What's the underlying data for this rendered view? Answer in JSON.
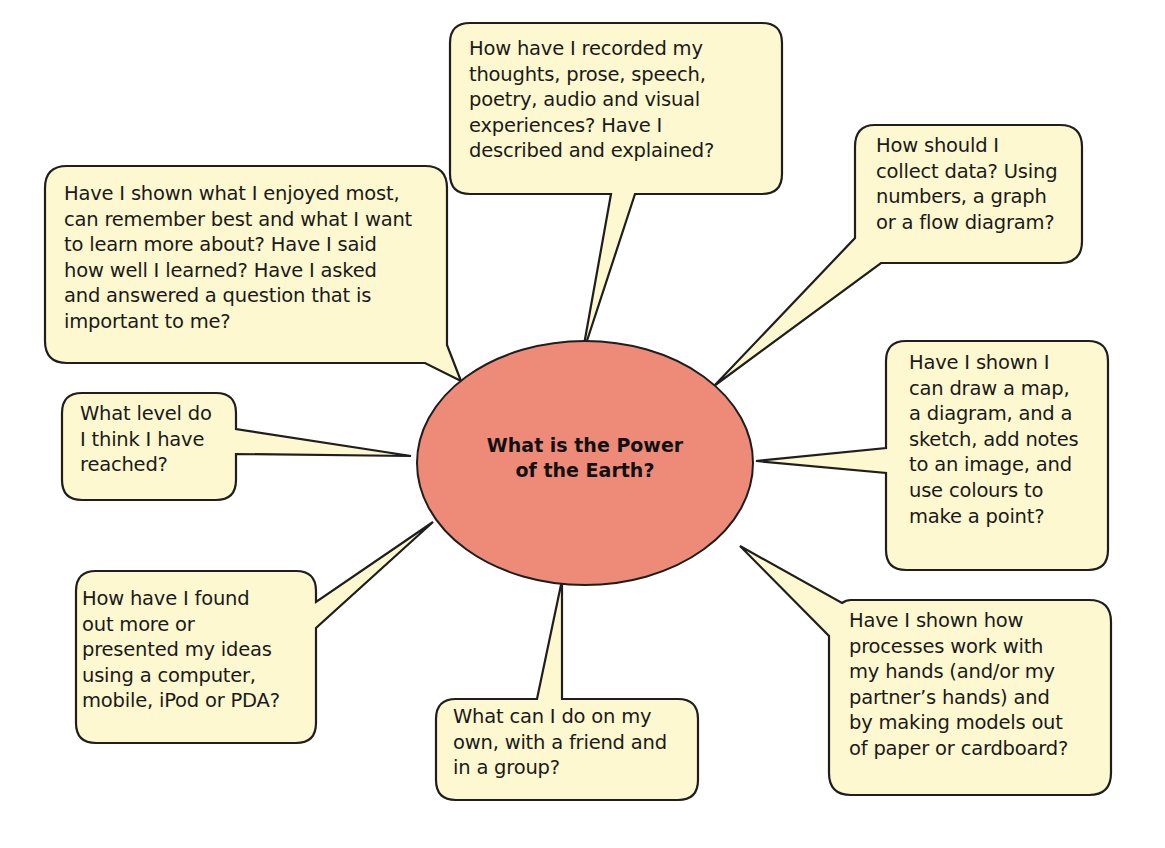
{
  "colors": {
    "bubble_fill": "#fdf8cf",
    "bubble_stroke": "#1e1e1e",
    "center_fill": "#ee8a78",
    "background": "#ffffff"
  },
  "center": {
    "label": "What is the Power\nof the Earth?"
  },
  "bubbles": [
    {
      "id": "recording",
      "text": "How have I recorded my\nthoughts, prose, speech,\npoetry, audio and visual\nexperiences? Have I\ndescribed and explained?"
    },
    {
      "id": "collect-data",
      "text": "How should I\ncollect data? Using\nnumbers, a graph\nor a flow diagram?"
    },
    {
      "id": "enjoyed-most",
      "text": "Have I shown what I enjoyed most,\ncan remember best and what I want\nto learn more about? Have I said\nhow well I learned? Have I asked\nand answered a question that is\nimportant to me?"
    },
    {
      "id": "level",
      "text": "What level do\nI think I have\nreached?"
    },
    {
      "id": "draw-map",
      "text": "Have I shown I\ncan draw a map,\na diagram, and a\nsketch, add notes\nto an image, and\nuse colours to\nmake a point?"
    },
    {
      "id": "computer",
      "text": "How have I found\nout more or\npresented my ideas\nusing a computer,\nmobile, iPod or PDA?"
    },
    {
      "id": "own-friend-group",
      "text": "What can I do on my\nown, with a friend and\nin a group?"
    },
    {
      "id": "hands-models",
      "text": "Have I shown how\nprocesses work with\nmy hands (and/or my\npartner’s hands) and\nby making models out\nof paper or cardboard?"
    }
  ]
}
